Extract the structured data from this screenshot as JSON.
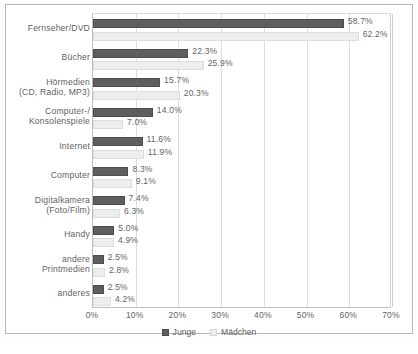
{
  "chart_data": {
    "type": "bar",
    "orientation": "horizontal",
    "title": "",
    "xlabel": "",
    "ylabel": "",
    "xlim": [
      0,
      70
    ],
    "grid": true,
    "legend_position": "bottom",
    "xticks": [
      "0%",
      "10%",
      "20%",
      "30%",
      "40%",
      "50%",
      "60%",
      "70%"
    ],
    "xtick_values": [
      0,
      10,
      20,
      30,
      40,
      50,
      60,
      70
    ],
    "categories": [
      "Fernseher/DVD",
      "Bücher",
      "Hörmedien (CD, Radio, MP3)",
      "Computer-/Konsolenspiele",
      "Internet",
      "Computer",
      "Digitalkamera (Foto/Film)",
      "Handy",
      "andere Printmedien",
      "anderes"
    ],
    "category_lines": [
      [
        "Fernseher/DVD",
        ""
      ],
      [
        "Bücher",
        ""
      ],
      [
        "Hörmedien",
        "(CD, Radio, MP3)"
      ],
      [
        "Computer-/",
        "Konsolenspiele"
      ],
      [
        "Internet",
        ""
      ],
      [
        "Computer",
        ""
      ],
      [
        "Digitalkamera",
        "(Foto/Film)"
      ],
      [
        "Handy",
        ""
      ],
      [
        "andere",
        "Printmedien"
      ],
      [
        "anderes",
        ""
      ]
    ],
    "series": [
      {
        "name": "Junge",
        "color": "#5e5e5e",
        "values": [
          58.7,
          22.3,
          15.7,
          14.0,
          11.6,
          8.3,
          7.4,
          5.0,
          2.5,
          2.5
        ],
        "labels": [
          "58.7%",
          "22.3%",
          "15.7%",
          "14.0%",
          "11.6%",
          "8.3%",
          "7.4%",
          "5.0%",
          "2.5%",
          "2.5%"
        ]
      },
      {
        "name": "Mädchen",
        "color": "#ededed",
        "values": [
          62.2,
          25.9,
          20.3,
          7.0,
          11.9,
          9.1,
          6.3,
          4.9,
          2.8,
          4.2
        ],
        "labels": [
          "62.2%",
          "25.9%",
          "20.3%",
          "7.0%",
          "11.9%",
          "9.1%",
          "6.3%",
          "4.9%",
          "2.8%",
          "4.2%"
        ]
      }
    ]
  },
  "legend": {
    "items": [
      {
        "label": "Junge",
        "swatch": "junge"
      },
      {
        "label": "Mädchen",
        "swatch": "maedchen"
      }
    ]
  }
}
